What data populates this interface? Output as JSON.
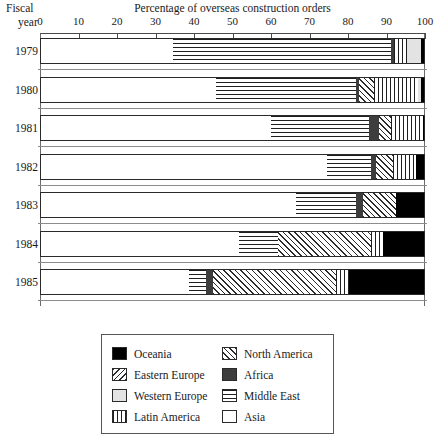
{
  "header": {
    "row_label_line1": "Fiscal",
    "row_label_line2": "year",
    "title": "Percentage of overseas construction orders"
  },
  "axis": {
    "ticks": [
      "0",
      "10",
      "20",
      "30",
      "40",
      "50",
      "60",
      "70",
      "80",
      "90",
      "100"
    ],
    "min": 0,
    "max": 100
  },
  "legend": {
    "column1": [
      {
        "label": "Oceania",
        "pattern": "solid-black"
      },
      {
        "label": "Eastern Europe",
        "pattern": "backslash-hatch"
      },
      {
        "label": "Western Europe",
        "pattern": "light-gray"
      },
      {
        "label": "Latin America",
        "pattern": "vertical-lines"
      }
    ],
    "column2": [
      {
        "label": "North America",
        "pattern": "forward-slash-hatch"
      },
      {
        "label": "Africa",
        "pattern": "dark-gray"
      },
      {
        "label": "Middle East",
        "pattern": "horizontal-lines"
      },
      {
        "label": "Asia",
        "pattern": "white"
      }
    ]
  },
  "chart_data": {
    "type": "bar",
    "orientation": "horizontal",
    "stacked": true,
    "title": "Percentage of overseas construction orders",
    "xlabel": "Percentage of overseas construction orders",
    "ylabel": "Fiscal year",
    "xlim": [
      0,
      100
    ],
    "grid": false,
    "legend_position": "bottom",
    "categories": [
      "1979",
      "1980",
      "1981",
      "1982",
      "1983",
      "1984",
      "1985"
    ],
    "series": [
      {
        "name": "Asia",
        "pattern": "white",
        "values": [
          34.3,
          45.5,
          59.7,
          74.3,
          66.2,
          51.4,
          38.4
        ]
      },
      {
        "name": "Middle East",
        "pattern": "horizontal-lines",
        "values": [
          56.6,
          36.4,
          25.5,
          11.4,
          15.6,
          10.1,
          4.4
        ]
      },
      {
        "name": "Africa",
        "pattern": "dark-gray",
        "values": [
          0.8,
          0.8,
          2.6,
          1.3,
          1.8,
          0.0,
          1.8
        ]
      },
      {
        "name": "North America",
        "pattern": "forward-slash-hatch",
        "values": [
          0.0,
          3.9,
          3.1,
          4.4,
          8.6,
          24.2,
          31.9
        ]
      },
      {
        "name": "Latin America",
        "pattern": "vertical-lines",
        "values": [
          3.4,
          11.2,
          8.3,
          6.0,
          0.0,
          3.1,
          3.4
        ]
      },
      {
        "name": "Western Europe",
        "pattern": "light-gray",
        "values": [
          3.6,
          0.9,
          0.0,
          0.0,
          0.0,
          0.0,
          0.0
        ]
      },
      {
        "name": "Eastern Europe",
        "pattern": "backslash-hatch",
        "values": [
          0.0,
          0.0,
          0.0,
          0.0,
          0.0,
          0.0,
          0.0
        ]
      },
      {
        "name": "Oceania",
        "pattern": "solid-black",
        "values": [
          1.3,
          1.3,
          0.8,
          2.6,
          7.8,
          11.2,
          20.1
        ]
      }
    ]
  }
}
